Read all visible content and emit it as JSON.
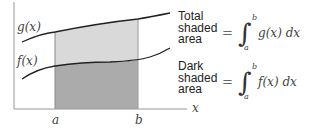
{
  "diagram": {
    "axes": {
      "x_label": "x",
      "ticks": [
        "a",
        "b"
      ]
    },
    "curves": [
      {
        "name": "g(x)",
        "label": "g(x)"
      },
      {
        "name": "f(x)",
        "label": "f(x)"
      }
    ],
    "colors": {
      "light_shade": "#d9d9d9",
      "dark_shade": "#ababab",
      "curve": "#222222",
      "axis": "#999999"
    },
    "legend": [
      {
        "line1": "Total",
        "line2": "shaded",
        "line3": "area",
        "equals": "=",
        "integral": "∫",
        "upper": "b",
        "lower": "a",
        "integrand": "g(x) dx"
      },
      {
        "line1": "Dark",
        "line2": "shaded",
        "line3": "area",
        "equals": "=",
        "integral": "∫",
        "upper": "b",
        "lower": "a",
        "integrand": "f(x) dx"
      }
    ]
  }
}
